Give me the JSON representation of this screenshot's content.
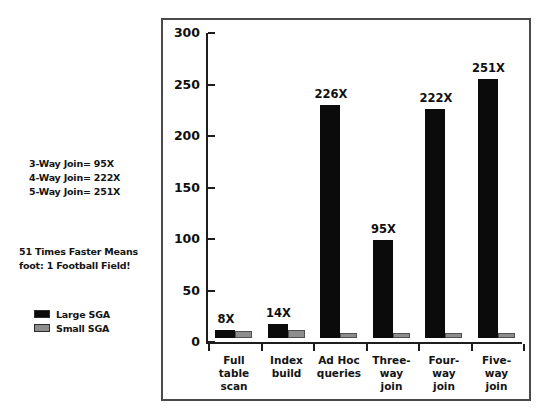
{
  "annotations": {
    "join_note": "3-Way Join= 95X\n4-Way Join= 222X\n5-Way Join= 251X",
    "faster_note": "51 Times Faster Means\nfoot: 1 Football Field!"
  },
  "legend": {
    "position": "left-outside",
    "entries": [
      {
        "label": "Large SGA",
        "color": "#0b0b0b"
      },
      {
        "label": "Small SGA",
        "color": "#8d8d8d"
      }
    ]
  },
  "chart_data": {
    "type": "bar",
    "title": "",
    "subtitle": "",
    "xlabel": "",
    "ylabel": "",
    "ylim": [
      0,
      300
    ],
    "yticks": [
      0,
      50,
      100,
      150,
      200,
      250,
      300
    ],
    "ytick_labels": [
      "0",
      "50",
      "100",
      "150",
      "200",
      "250",
      "300"
    ],
    "grid": false,
    "legend_position": "left-outside",
    "categories": [
      "Full\ntable\nscan",
      "Index\nbuild",
      "Ad Hoc\nqueries",
      "Three-\nway\njoin",
      "Four-\nway\njoin",
      "Five-\nway\njoin"
    ],
    "series": [
      {
        "name": "Large SGA",
        "color": "#0b0b0b",
        "values": [
          8,
          14,
          226,
          95,
          222,
          251
        ],
        "data_labels": [
          "8X",
          "14X",
          "226X",
          "95X",
          "222X",
          "251X"
        ]
      },
      {
        "name": "Small SGA",
        "color": "#8d8d8d",
        "values": [
          7,
          8,
          5,
          5,
          5,
          5
        ],
        "data_labels": [
          "",
          "",
          "",
          "",
          "",
          ""
        ]
      }
    ]
  }
}
